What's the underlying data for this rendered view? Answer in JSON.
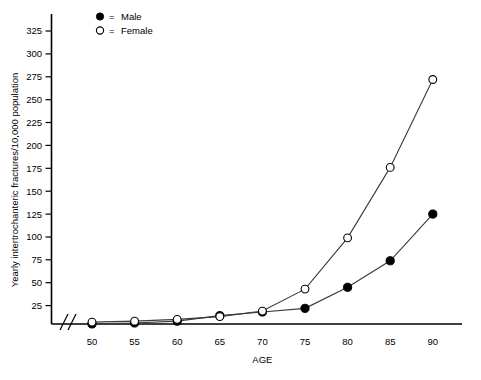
{
  "chart_data": {
    "type": "line",
    "title": "",
    "xlabel": "AGE",
    "ylabel": "Yearly intertrochanteric fractures/10,000 population",
    "x": [
      50,
      55,
      60,
      65,
      70,
      75,
      80,
      85,
      90
    ],
    "xtick_labels": [
      "50",
      "55",
      "60",
      "65",
      "70",
      "75",
      "80",
      "85",
      "90"
    ],
    "ytick_labels": [
      "25",
      "50",
      "75",
      "100",
      "125",
      "150",
      "175",
      "200",
      "225",
      "250",
      "275",
      "300",
      "325"
    ],
    "ytick_values": [
      25,
      50,
      75,
      100,
      125,
      150,
      175,
      200,
      225,
      250,
      275,
      300,
      325
    ],
    "xlim": [
      47,
      93
    ],
    "ylim": [
      0,
      340
    ],
    "grid": false,
    "legend_position": "top-left",
    "axis_break": "x-axis break near origin",
    "series": [
      {
        "name": "Male",
        "marker": "filled-circle",
        "legend_symbol": "●",
        "legend_equals": "=",
        "color": "#000000",
        "values": [
          5,
          6,
          8,
          14,
          18,
          22,
          45,
          74,
          125
        ]
      },
      {
        "name": "Female",
        "marker": "open-circle",
        "legend_symbol": "○",
        "legend_equals": "=",
        "color": "#ffffff",
        "values": [
          7,
          8,
          10,
          13,
          19,
          43,
          99,
          176,
          272
        ]
      }
    ]
  },
  "legend": {
    "items": [
      {
        "symbol": "●",
        "equals": "=",
        "label": "Male"
      },
      {
        "symbol": "○",
        "equals": "=",
        "label": "Female"
      }
    ]
  },
  "axes": {
    "y_title": "Yearly intertrochanteric fractures/10,000 population",
    "x_title": "AGE"
  }
}
